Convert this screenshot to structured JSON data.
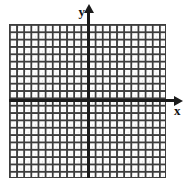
{
  "figure": {
    "type": "coordinate-grid",
    "background_color": "#ffffff",
    "grid": {
      "line_color": "#3d3d3d",
      "cell_fill_color": "#fdfdfd",
      "columns": 22,
      "rows": 21,
      "columns_left_of_y_axis": 11,
      "columns_right_of_y_axis": 11,
      "rows_above_x_axis": 10,
      "rows_below_x_axis": 11,
      "tick_labels": [],
      "numbers_shown": false
    },
    "axes": {
      "color": "#1b1b1b",
      "x": {
        "label": "x",
        "arrow": "right",
        "origin_offset_from_top_percent": 49
      },
      "y": {
        "label": "y",
        "arrow": "up",
        "origin_offset_from_left_percent": 46
      }
    }
  },
  "chart_data": {
    "type": "scatter",
    "title": "",
    "subtitle": "",
    "xlabel": "x",
    "ylabel": "y",
    "grid": true,
    "legend": null,
    "annotations": [],
    "series": [],
    "x": [],
    "values": [],
    "xlim": [
      -11,
      11
    ],
    "ylim": [
      -11,
      10
    ],
    "xticks": [],
    "yticks": [],
    "note": "Empty graph paper / blank coordinate plane - no plotted data points, no numeric tick labels"
  }
}
